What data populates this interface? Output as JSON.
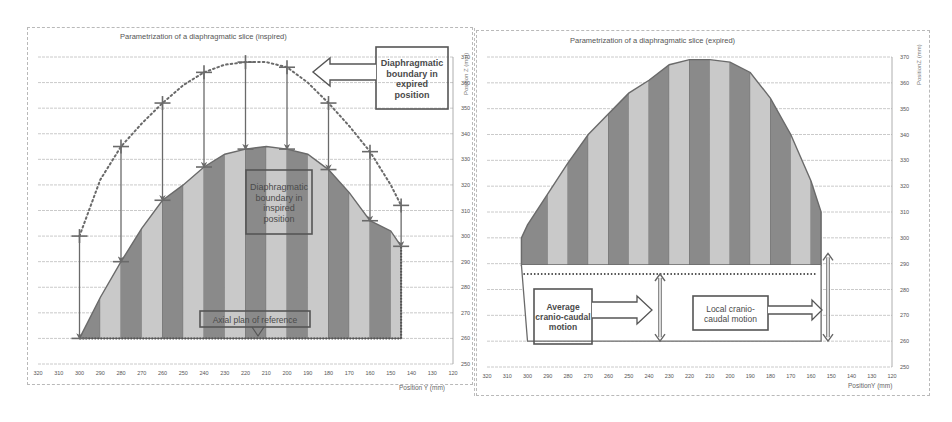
{
  "colors": {
    "dark_band": "#8a8a8a",
    "light_band": "#c9c9c9",
    "outline": "#6a6a6a",
    "grid": "#bdbdbd",
    "text": "#555555",
    "annotation_border": "#555555"
  },
  "chart_data": [
    {
      "type": "area",
      "title": "Parametrization of a diaphragmatic slice (inspired)",
      "xlabel": "Position Y (mm)",
      "ylabel": "Position Z (mm)",
      "x_ticks": [
        320,
        310,
        300,
        290,
        280,
        270,
        260,
        250,
        240,
        230,
        220,
        210,
        200,
        190,
        180,
        170,
        160,
        150,
        140,
        130,
        120
      ],
      "y_ticks": [
        250,
        260,
        270,
        280,
        290,
        300,
        310,
        320,
        330,
        340,
        350,
        360,
        370
      ],
      "xlim": [
        320,
        120
      ],
      "ylim": [
        250,
        370
      ],
      "grid": "horizontal",
      "series": [
        {
          "name": "Diaphragmatic boundary in inspired position",
          "style": "filled area with alternating vertical bands",
          "x": [
            300,
            290,
            280,
            270,
            260,
            250,
            240,
            230,
            220,
            210,
            200,
            190,
            180,
            170,
            160,
            150,
            145
          ],
          "y": [
            260,
            276,
            290,
            303,
            314,
            320,
            327,
            332,
            334,
            335,
            334,
            332,
            326,
            317,
            306,
            302,
            296
          ]
        },
        {
          "name": "Diaphragmatic boundary in expired position",
          "style": "dotted line with cross markers",
          "x": [
            300,
            290,
            280,
            270,
            260,
            250,
            240,
            230,
            220,
            210,
            200,
            190,
            180,
            170,
            160,
            150,
            145
          ],
          "y": [
            300,
            322,
            335,
            344,
            352,
            359,
            364,
            367,
            368,
            368,
            366,
            360,
            352,
            343,
            333,
            320,
            312
          ]
        }
      ],
      "reference_line": {
        "label": "Axial plan of reference",
        "y": 260
      },
      "annotations": [
        {
          "text": "Diaphragmatic boundary in expired position",
          "position": "top-right"
        },
        {
          "text": "Diaphragmatic boundary in inspired position",
          "position": "center"
        },
        {
          "text": "Axial plan of reference",
          "position": "bottom-center"
        }
      ]
    },
    {
      "type": "area",
      "title": "Parametrization of a diaphragmatic slice (expired)",
      "xlabel": "PositionY (mm)",
      "ylabel": "PositionZ (mm)",
      "x_ticks": [
        320,
        310,
        300,
        290,
        280,
        270,
        260,
        250,
        240,
        230,
        220,
        210,
        200,
        190,
        180,
        170,
        160,
        150,
        140,
        130,
        120
      ],
      "y_ticks": [
        250,
        260,
        270,
        280,
        290,
        300,
        310,
        320,
        330,
        340,
        350,
        360,
        370
      ],
      "xlim": [
        320,
        120
      ],
      "ylim": [
        250,
        370
      ],
      "grid": "horizontal",
      "series": [
        {
          "name": "Diaphragmatic slice (expired)",
          "style": "filled area with alternating vertical bands",
          "x": [
            303,
            300,
            290,
            280,
            270,
            260,
            250,
            240,
            230,
            220,
            210,
            200,
            190,
            180,
            170,
            160,
            155
          ],
          "y": [
            300,
            305,
            317,
            329,
            340,
            348,
            356,
            361,
            367,
            369,
            369,
            368,
            364,
            354,
            340,
            322,
            310
          ]
        }
      ],
      "average_line": {
        "y": 286
      },
      "base_line": {
        "y": 260
      },
      "annotations": [
        {
          "text": "Average cranio-caudal motion",
          "position": "bottom-left"
        },
        {
          "text": "Local cranio-caudal motion",
          "position": "bottom-right"
        }
      ]
    }
  ],
  "left": {
    "title": "Parametrization of a diaphragmatic slice (inspired)",
    "xlabel": "Position Y (mm)",
    "ylabel": "Position Z (mm)",
    "callout_expired": [
      "Diaphragmatic",
      "boundary in",
      "expired",
      "position"
    ],
    "callout_inspired": [
      "Diaphragmatic",
      "boundary in",
      "inspired",
      "position"
    ],
    "callout_reference": "Axial plan of reference"
  },
  "right": {
    "title": "Parametrization of a diaphragmatic slice (expired)",
    "xlabel": "PositionY (mm)",
    "ylabel": "PositionZ (mm)",
    "callout_average": [
      "Average",
      "cranio-caudal",
      "motion"
    ],
    "callout_local": [
      "Local cranio-",
      "caudal motion"
    ]
  }
}
